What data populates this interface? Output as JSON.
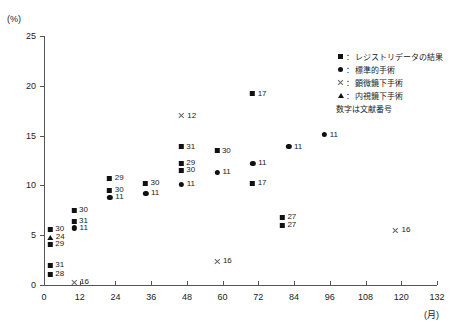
{
  "chart_data": {
    "type": "scatter",
    "title": "",
    "xlabel": "(月)",
    "ylabel": "(%)",
    "xlim": [
      0,
      132
    ],
    "ylim": [
      0,
      25
    ],
    "xticks": [
      0,
      12,
      24,
      36,
      48,
      60,
      72,
      84,
      96,
      108,
      120,
      132
    ],
    "yticks": [
      0,
      5,
      10,
      15,
      20,
      25
    ],
    "grid": false,
    "legend_position": "top-right",
    "series": [
      {
        "name": "レジストリデータの結果",
        "marker": "square",
        "points": [
          {
            "x": 4,
            "y": 5.6,
            "label": "30"
          },
          {
            "x": 4,
            "y": 4.1,
            "label": "29"
          },
          {
            "x": 4,
            "y": 2.0,
            "label": "31"
          },
          {
            "x": 4,
            "y": 1.1,
            "label": "28"
          },
          {
            "x": 12,
            "y": 7.5,
            "label": "30"
          },
          {
            "x": 12,
            "y": 6.4,
            "label": "31"
          },
          {
            "x": 24,
            "y": 10.7,
            "label": "29"
          },
          {
            "x": 24,
            "y": 9.5,
            "label": "30"
          },
          {
            "x": 36,
            "y": 10.2,
            "label": "30"
          },
          {
            "x": 48,
            "y": 13.9,
            "label": "31"
          },
          {
            "x": 48,
            "y": 12.2,
            "label": "29"
          },
          {
            "x": 48,
            "y": 11.5,
            "label": "30"
          },
          {
            "x": 60,
            "y": 13.5,
            "label": "30"
          },
          {
            "x": 72,
            "y": 19.2,
            "label": "17"
          },
          {
            "x": 72,
            "y": 10.2,
            "label": "17"
          },
          {
            "x": 82,
            "y": 6.8,
            "label": "27"
          },
          {
            "x": 82,
            "y": 6.0,
            "label": "27"
          }
        ]
      },
      {
        "name": "標準的手術",
        "marker": "circle",
        "points": [
          {
            "x": 12,
            "y": 5.7,
            "label": "11"
          },
          {
            "x": 24,
            "y": 8.8,
            "label": "11"
          },
          {
            "x": 36,
            "y": 9.2,
            "label": "11"
          },
          {
            "x": 48,
            "y": 10.1,
            "label": "11"
          },
          {
            "x": 60,
            "y": 11.3,
            "label": "11"
          },
          {
            "x": 72,
            "y": 12.2,
            "label": "11"
          },
          {
            "x": 84,
            "y": 13.9,
            "label": "11"
          },
          {
            "x": 96,
            "y": 15.1,
            "label": "11"
          }
        ]
      },
      {
        "name": "顕微鏡下手術",
        "marker": "cross",
        "points": [
          {
            "x": 12,
            "y": 0.3,
            "label": "16"
          },
          {
            "x": 48,
            "y": 17.0,
            "label": "12"
          },
          {
            "x": 60,
            "y": 2.4,
            "label": "16"
          },
          {
            "x": 120,
            "y": 5.5,
            "label": "16"
          }
        ]
      },
      {
        "name": "内視鏡下手術",
        "marker": "triangle",
        "points": [
          {
            "x": 4,
            "y": 4.8,
            "label": "24"
          }
        ]
      }
    ]
  },
  "legend": {
    "colon": "：",
    "items": [
      {
        "symbol": "square",
        "label": "レジストリデータの結果"
      },
      {
        "symbol": "circle",
        "label": "標準的手術"
      },
      {
        "symbol": "cross",
        "label": "顕微鏡下手術"
      },
      {
        "symbol": "triangle",
        "label": "内視鏡下手術"
      }
    ],
    "note": "数字は文献番号"
  }
}
